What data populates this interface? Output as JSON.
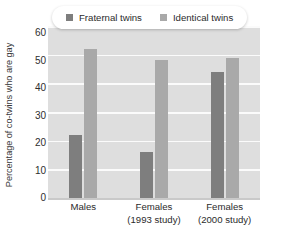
{
  "chart_data": {
    "type": "bar",
    "title": "",
    "xlabel": "",
    "ylabel": "Percentage of co-twins who are gay",
    "ylim": [
      0,
      60
    ],
    "yticks": [
      0,
      10,
      20,
      30,
      40,
      50,
      60
    ],
    "grid": true,
    "legend_position": "top",
    "categories": [
      "Males",
      "Females (1993 study)",
      "Females (2000 study)"
    ],
    "category_lines": [
      {
        "line1": "Males",
        "line2": ""
      },
      {
        "line1": "Females",
        "line2": "(1993 study)"
      },
      {
        "line1": "Females",
        "line2": "(2000 study)"
      }
    ],
    "series": [
      {
        "name": "Fraternal twins",
        "color": "#7e7e7e",
        "values": [
          22,
          16,
          44
        ]
      },
      {
        "name": "Identical twins",
        "color": "#a9a9a9",
        "values": [
          52,
          48,
          49
        ]
      }
    ]
  },
  "colors": {
    "plot_background": "#dedede",
    "gridline": "#fbfbfb",
    "page_background": "#ffffff",
    "fraternal": "#7e7e7e",
    "identical": "#a9a9a9",
    "text": "#2b2b2b"
  },
  "legend": {
    "items": [
      {
        "label": "Fraternal twins",
        "swatch": "fraternal"
      },
      {
        "label": "Identical twins",
        "swatch": "identical"
      }
    ]
  },
  "y_axis": {
    "title": "Percentage of co-twins who are gay",
    "ticks": [
      "60",
      "50",
      "40",
      "30",
      "20",
      "10",
      "0"
    ]
  }
}
